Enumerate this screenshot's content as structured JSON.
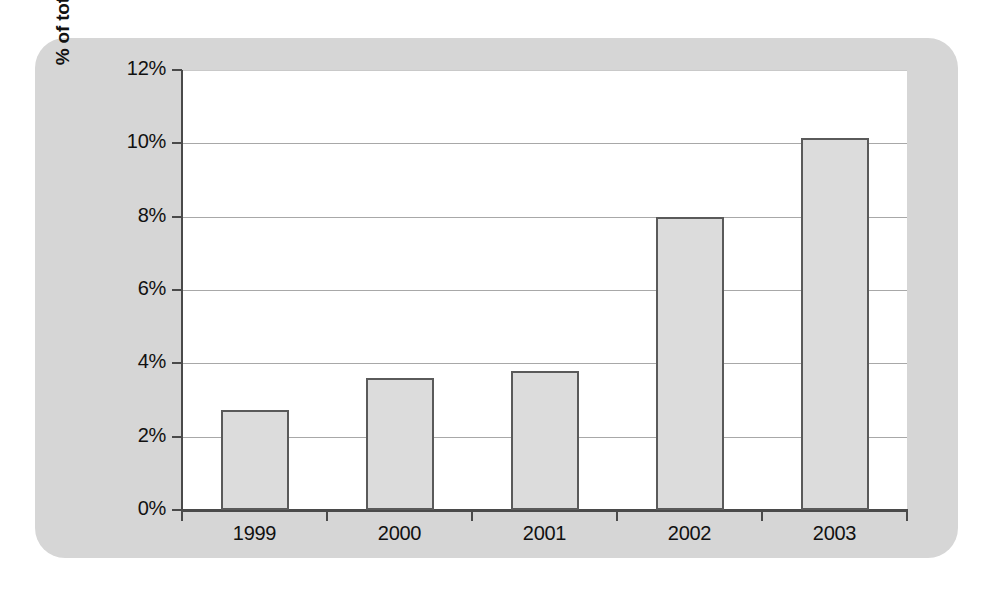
{
  "chart_data": {
    "type": "bar",
    "title": "",
    "subtitle": "",
    "xlabel": "",
    "ylabel": "% of total respondents",
    "categories": [
      "1999",
      "2000",
      "2001",
      "2002",
      "2003"
    ],
    "values": [
      2.74,
      3.6,
      3.8,
      8.0,
      10.15
    ],
    "value_labels": [
      "2.74%",
      "3.6%",
      "3.8%",
      "8.0%",
      "10.15%"
    ],
    "ylim": [
      0,
      12
    ],
    "ytick_values": [
      0,
      2,
      4,
      6,
      8,
      10,
      12
    ],
    "ytick_labels": [
      "0%",
      "2%",
      "4%",
      "6%",
      "8%",
      "10%",
      "12%"
    ],
    "grid": true,
    "grid_axis": "y",
    "legend": false,
    "legend_position": "none",
    "series": [
      {
        "name": "% of total respondents",
        "values": [
          2.74,
          3.6,
          3.8,
          8.0,
          10.15
        ]
      }
    ],
    "annotations": []
  },
  "style": {
    "panel_background": "#d6d6d6",
    "plot_background": "#ffffff",
    "bar_fill": "#dcdcdc",
    "bar_border": "#5a5a5a",
    "axis_color": "#4a4a4a",
    "gridline_color": "#a8a8a8",
    "text_color": "#111111"
  }
}
